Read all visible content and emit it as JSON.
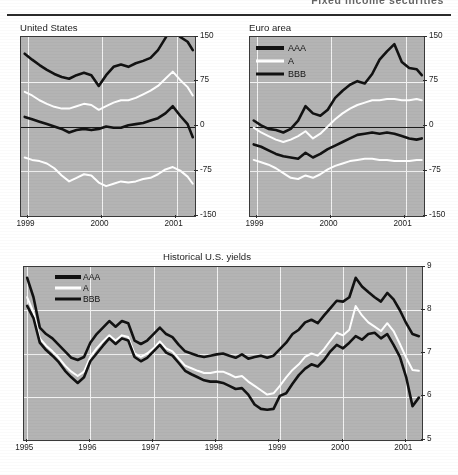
{
  "page": {
    "header_text": "Fixed income securities"
  },
  "panels": {
    "us": {
      "title": "United States",
      "y_ticks": [
        "150",
        "75",
        "0",
        "-75",
        "-150"
      ],
      "x_ticks": [
        "1999",
        "2000",
        "2001"
      ]
    },
    "euro": {
      "title": "Euro area",
      "y_ticks": [
        "150",
        "75",
        "0",
        "-75",
        "-150"
      ],
      "x_ticks": [
        "1999",
        "2000",
        "2001"
      ],
      "legend": [
        {
          "label": "AAA",
          "style": "thick-black"
        },
        {
          "label": "A",
          "style": "white"
        },
        {
          "label": "BBB",
          "style": "black"
        }
      ]
    },
    "hist": {
      "title": "Historical U.S. yields",
      "y_ticks": [
        "9",
        "8",
        "7",
        "6",
        "5"
      ],
      "x_ticks": [
        "1995",
        "1996",
        "1997",
        "1998",
        "1999",
        "2000",
        "2001"
      ],
      "legend": [
        {
          "label": "AAA",
          "style": "thick-black"
        },
        {
          "label": "A",
          "style": "white"
        },
        {
          "label": "BBB",
          "style": "black"
        }
      ]
    }
  },
  "colors": {
    "plot_background": "#b4b4b4",
    "gridline": "#f2f2f2",
    "series_dark": "#121212",
    "series_light": "#ffffff",
    "axis": "#3a3a3a"
  },
  "chart_data": [
    {
      "id": "us-spreads",
      "type": "line",
      "title": "United States",
      "xlabel": "",
      "ylabel": "",
      "xlim": [
        1998.9,
        2001.25
      ],
      "ylim": [
        -150,
        150
      ],
      "x_tick_values": [
        1999,
        2000,
        2001
      ],
      "x_tick_labels": [
        "1999",
        "2000",
        "2001"
      ],
      "y_tick_values": [
        150,
        75,
        0,
        -75,
        -150
      ],
      "y_tick_labels": [
        "150",
        "75",
        "0",
        "-75",
        "-150"
      ],
      "grid": true,
      "legend": "none",
      "x": [
        1998.95,
        1999.05,
        1999.15,
        1999.25,
        1999.35,
        1999.45,
        1999.55,
        1999.65,
        1999.75,
        1999.85,
        1999.95,
        2000.05,
        2000.15,
        2000.25,
        2000.35,
        2000.45,
        2000.55,
        2000.65,
        2000.75,
        2000.85,
        2000.95,
        2001.05,
        2001.15,
        2001.22
      ],
      "series": [
        {
          "name": "BBB spread (upper dark)",
          "style": "thick-black",
          "values": [
            122,
            112,
            103,
            95,
            88,
            83,
            80,
            86,
            90,
            86,
            68,
            86,
            100,
            104,
            100,
            106,
            110,
            115,
            128,
            148,
            172,
            150,
            142,
            128
          ]
        },
        {
          "name": "A spread (upper white)",
          "style": "white",
          "values": [
            58,
            52,
            44,
            38,
            33,
            30,
            30,
            34,
            38,
            36,
            28,
            34,
            40,
            44,
            44,
            48,
            54,
            60,
            68,
            80,
            92,
            78,
            66,
            52
          ]
        },
        {
          "name": "AAA spread (lower dark)",
          "style": "thick-black",
          "values": [
            16,
            12,
            8,
            4,
            0,
            -4,
            -10,
            -6,
            -4,
            -6,
            -4,
            0,
            -2,
            -2,
            2,
            4,
            6,
            10,
            14,
            22,
            34,
            18,
            4,
            -18
          ]
        },
        {
          "name": "Treasury-relative (lower white)",
          "style": "white",
          "values": [
            -52,
            -56,
            -58,
            -62,
            -70,
            -82,
            -92,
            -86,
            -80,
            -82,
            -94,
            -100,
            -96,
            -92,
            -94,
            -92,
            -88,
            -86,
            -80,
            -72,
            -68,
            -74,
            -84,
            -96
          ]
        }
      ]
    },
    {
      "id": "euro-spreads",
      "type": "line",
      "title": "Euro area",
      "xlabel": "",
      "ylabel": "",
      "xlim": [
        1998.9,
        2001.25
      ],
      "ylim": [
        -150,
        150
      ],
      "x_tick_values": [
        1999,
        2000,
        2001
      ],
      "x_tick_labels": [
        "1999",
        "2000",
        "2001"
      ],
      "y_tick_values": [
        150,
        75,
        0,
        -75,
        -150
      ],
      "y_tick_labels": [
        "150",
        "75",
        "0",
        "-75",
        "-150"
      ],
      "grid": true,
      "legend": "top-left",
      "legend_entries": [
        "AAA",
        "A",
        "BBB"
      ],
      "x": [
        1998.95,
        1999.05,
        1999.15,
        1999.25,
        1999.35,
        1999.45,
        1999.55,
        1999.65,
        1999.75,
        1999.85,
        1999.95,
        2000.05,
        2000.15,
        2000.25,
        2000.35,
        2000.45,
        2000.55,
        2000.65,
        2000.75,
        2000.85,
        2000.95,
        2001.05,
        2001.15,
        2001.22
      ],
      "series": [
        {
          "name": "BBB",
          "style": "thick-black",
          "values": [
            10,
            2,
            -4,
            -6,
            -10,
            -4,
            10,
            34,
            22,
            18,
            28,
            48,
            60,
            70,
            76,
            72,
            88,
            112,
            126,
            138,
            108,
            98,
            96,
            86
          ]
        },
        {
          "name": "A",
          "style": "white",
          "values": [
            -2,
            -10,
            -16,
            -22,
            -26,
            -22,
            -16,
            -8,
            -20,
            -12,
            0,
            12,
            22,
            30,
            36,
            40,
            44,
            44,
            46,
            46,
            44,
            44,
            46,
            44
          ]
        },
        {
          "name": "AAA",
          "style": "thick-black",
          "values": [
            -30,
            -34,
            -40,
            -46,
            -50,
            -52,
            -54,
            -44,
            -52,
            -46,
            -38,
            -32,
            -26,
            -20,
            -14,
            -12,
            -10,
            -12,
            -10,
            -12,
            -16,
            -20,
            -22,
            -20
          ]
        },
        {
          "name": "Government benchmark (lower white)",
          "style": "white",
          "values": [
            -56,
            -60,
            -64,
            -70,
            -78,
            -86,
            -88,
            -82,
            -86,
            -80,
            -72,
            -66,
            -62,
            -58,
            -56,
            -54,
            -54,
            -56,
            -56,
            -58,
            -58,
            -58,
            -56,
            -56
          ]
        }
      ]
    },
    {
      "id": "historical-us-yields",
      "type": "line",
      "title": "Historical U.S. yields",
      "xlabel": "",
      "ylabel": "",
      "xlim": [
        1994.95,
        2001.25
      ],
      "ylim": [
        5,
        9
      ],
      "x_tick_values": [
        1995,
        1996,
        1997,
        1998,
        1999,
        2000,
        2001
      ],
      "x_tick_labels": [
        "1995",
        "1996",
        "1997",
        "1998",
        "1999",
        "2000",
        "2001"
      ],
      "y_tick_values": [
        9,
        8,
        7,
        6,
        5
      ],
      "y_tick_labels": [
        "9",
        "8",
        "7",
        "6",
        "5"
      ],
      "grid": true,
      "legend": "top-left",
      "legend_entries": [
        "AAA",
        "A",
        "BBB"
      ],
      "x": [
        1995.0,
        1995.1,
        1995.2,
        1995.3,
        1995.4,
        1995.5,
        1995.6,
        1995.7,
        1995.8,
        1995.9,
        1996.0,
        1996.1,
        1996.2,
        1996.3,
        1996.4,
        1996.5,
        1996.6,
        1996.7,
        1996.8,
        1996.9,
        1997.0,
        1997.1,
        1997.2,
        1997.3,
        1997.4,
        1997.5,
        1997.6,
        1997.7,
        1997.8,
        1997.9,
        1998.0,
        1998.1,
        1998.2,
        1998.3,
        1998.4,
        1998.5,
        1998.6,
        1998.7,
        1998.8,
        1998.9,
        1999.0,
        1999.1,
        1999.2,
        1999.3,
        1999.4,
        1999.5,
        1999.6,
        1999.7,
        1999.8,
        1999.9,
        2000.0,
        2000.1,
        2000.2,
        2000.3,
        2000.4,
        2000.5,
        2000.6,
        2000.7,
        2000.8,
        2000.9,
        2001.0,
        2001.1,
        2001.2
      ],
      "series": [
        {
          "name": "BBB",
          "style": "thick-black",
          "values": [
            8.75,
            8.3,
            7.6,
            7.45,
            7.35,
            7.2,
            7.05,
            6.9,
            6.85,
            6.92,
            7.25,
            7.45,
            7.6,
            7.75,
            7.62,
            7.75,
            7.7,
            7.3,
            7.22,
            7.3,
            7.45,
            7.6,
            7.45,
            7.38,
            7.2,
            7.05,
            7.0,
            6.95,
            6.92,
            6.95,
            6.98,
            7.0,
            6.95,
            6.9,
            6.98,
            6.88,
            6.92,
            6.95,
            6.9,
            6.95,
            7.1,
            7.25,
            7.45,
            7.55,
            7.72,
            7.78,
            7.7,
            7.88,
            8.05,
            8.22,
            8.2,
            8.3,
            8.75,
            8.55,
            8.42,
            8.3,
            8.2,
            8.4,
            8.25,
            8.0,
            7.7,
            7.45,
            7.4
          ]
        },
        {
          "name": "A",
          "style": "white",
          "values": [
            8.3,
            7.95,
            7.35,
            7.18,
            7.05,
            6.9,
            6.72,
            6.58,
            6.48,
            6.58,
            6.92,
            7.12,
            7.28,
            7.42,
            7.3,
            7.42,
            7.38,
            7.0,
            6.92,
            7.0,
            7.12,
            7.28,
            7.12,
            7.05,
            6.88,
            6.72,
            6.66,
            6.6,
            6.55,
            6.55,
            6.58,
            6.58,
            6.52,
            6.45,
            6.48,
            6.35,
            6.25,
            6.15,
            6.05,
            6.08,
            6.25,
            6.45,
            6.62,
            6.75,
            6.92,
            7.0,
            6.95,
            7.1,
            7.3,
            7.48,
            7.42,
            7.55,
            8.1,
            7.88,
            7.72,
            7.62,
            7.52,
            7.7,
            7.52,
            7.22,
            6.9,
            6.62,
            6.6
          ]
        },
        {
          "name": "AAA",
          "style": "thick-black",
          "values": [
            8.1,
            7.82,
            7.25,
            7.08,
            6.95,
            6.8,
            6.6,
            6.45,
            6.32,
            6.45,
            6.82,
            7.0,
            7.18,
            7.35,
            7.22,
            7.35,
            7.3,
            6.92,
            6.82,
            6.9,
            7.05,
            7.2,
            7.02,
            6.95,
            6.78,
            6.6,
            6.52,
            6.45,
            6.38,
            6.35,
            6.35,
            6.32,
            6.25,
            6.18,
            6.2,
            6.05,
            5.82,
            5.72,
            5.7,
            5.72,
            6.02,
            6.08,
            6.3,
            6.5,
            6.65,
            6.75,
            6.7,
            6.85,
            7.05,
            7.2,
            7.12,
            7.25,
            7.4,
            7.32,
            7.45,
            7.48,
            7.35,
            7.45,
            7.2,
            6.92,
            6.45,
            5.78,
            5.98
          ]
        }
      ]
    }
  ]
}
